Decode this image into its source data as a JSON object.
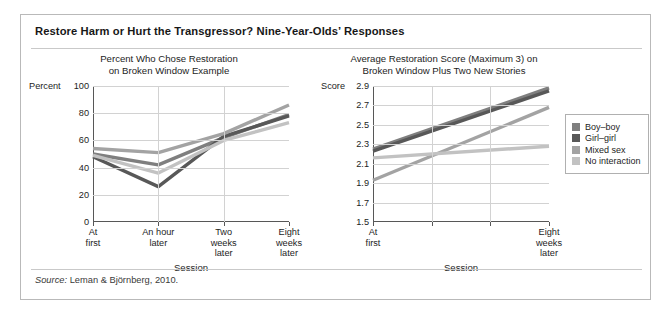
{
  "figure": {
    "title": "Restore Harm or Hurt the Transgressor? Nine-Year-Olds’ Responses",
    "source_prefix": "Source:",
    "source_text": "Leman & Björnberg, 2010."
  },
  "legend": {
    "position": "right",
    "items": [
      {
        "label": "Boy–boy",
        "color": "#7f7f7f"
      },
      {
        "label": "Girl–girl",
        "color": "#585858"
      },
      {
        "label": "Mixed sex",
        "color": "#a3a3a3"
      },
      {
        "label": "No interaction",
        "color": "#c2c2c2"
      }
    ]
  },
  "chart_data": [
    {
      "id": "left",
      "type": "line",
      "title": "Percent Who Chose Restoration\non Broken Window Example",
      "title_line1": "Percent Who Chose Restoration",
      "title_line2": "on Broken Window Example",
      "xlabel": "Session",
      "ylabel": "Percent",
      "ylim": [
        0,
        100
      ],
      "yticks": [
        0,
        20,
        40,
        60,
        80,
        100
      ],
      "ytick_labels": [
        "0",
        "20",
        "40",
        "60",
        "80",
        "100"
      ],
      "grid": true,
      "categories": [
        "At first",
        "An hour later",
        "Two weeks later",
        "Eight weeks later"
      ],
      "category_lines": [
        [
          "At",
          "first"
        ],
        [
          "An hour",
          "later"
        ],
        [
          "Two",
          "weeks",
          "later"
        ],
        [
          "Eight",
          "weeks",
          "later"
        ]
      ],
      "series": [
        {
          "name": "Boy–boy",
          "color": "#7f7f7f",
          "values": [
            50,
            42,
            62,
            79
          ]
        },
        {
          "name": "Girl–girl",
          "color": "#585858",
          "values": [
            48,
            26,
            63,
            78
          ]
        },
        {
          "name": "Mixed sex",
          "color": "#a3a3a3",
          "values": [
            54,
            51,
            65,
            86
          ]
        },
        {
          "name": "No interaction",
          "color": "#c2c2c2",
          "values": [
            49,
            36,
            60,
            73
          ]
        }
      ]
    },
    {
      "id": "right",
      "type": "line",
      "title": "Average Restoration Score (Maximum 3) on\nBroken Window Plus Two New Stories",
      "title_line1": "Average Restoration Score (Maximum 3) on",
      "title_line2": "Broken Window Plus Two New Stories",
      "xlabel": "Session",
      "ylabel": "Score",
      "ylim": [
        1.5,
        2.9
      ],
      "yticks": [
        1.5,
        1.7,
        1.9,
        2.1,
        2.3,
        2.5,
        2.7,
        2.9
      ],
      "ytick_labels": [
        "1.5",
        "1.7",
        "1.9",
        "2.1",
        "2.3",
        "2.5",
        "2.7",
        "2.9"
      ],
      "grid": true,
      "categories": [
        "At first",
        "",
        "",
        "Eight weeks later"
      ],
      "category_lines": [
        [
          "At",
          "first"
        ],
        [
          ""
        ],
        [
          ""
        ],
        [
          "Eight",
          "weeks",
          "later"
        ]
      ],
      "series": [
        {
          "name": "Boy–boy",
          "color": "#7f7f7f",
          "values": [
            2.25,
            null,
            null,
            2.88
          ]
        },
        {
          "name": "Girl–girl",
          "color": "#585858",
          "values": [
            2.23,
            null,
            null,
            2.85
          ]
        },
        {
          "name": "Mixed sex",
          "color": "#a3a3a3",
          "values": [
            1.93,
            null,
            null,
            2.68
          ]
        },
        {
          "name": "No interaction",
          "color": "#c2c2c2",
          "values": [
            2.16,
            null,
            null,
            2.28
          ]
        }
      ]
    }
  ]
}
